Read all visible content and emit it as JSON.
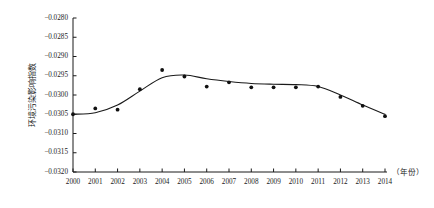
{
  "chart_data": {
    "type": "scatter",
    "title": "",
    "subtitle": "",
    "xlabel": "（年份）",
    "ylabel": "环境污染影响指数",
    "x": [
      2000,
      2001,
      2002,
      2003,
      2004,
      2005,
      2006,
      2007,
      2008,
      2009,
      2010,
      2011,
      2012,
      2013,
      2014
    ],
    "categories": [
      "2000",
      "2001",
      "2002",
      "2003",
      "2004",
      "2005",
      "2006",
      "2007",
      "2008",
      "2009",
      "2010",
      "2011",
      "2012",
      "2013",
      "2014"
    ],
    "values": [
      -0.0305,
      -0.03035,
      -0.03038,
      -0.02985,
      -0.02935,
      -0.02952,
      -0.02978,
      -0.02967,
      -0.0298,
      -0.0298,
      -0.0298,
      -0.02978,
      -0.03005,
      -0.03028,
      -0.03055
    ],
    "series": [
      {
        "name": "环境污染影响指数",
        "marker": "filled-circle",
        "color": "#111111",
        "values": [
          -0.0305,
          -0.03035,
          -0.03038,
          -0.02985,
          -0.02935,
          -0.02952,
          -0.02978,
          -0.02967,
          -0.0298,
          -0.0298,
          -0.0298,
          -0.02978,
          -0.03005,
          -0.03028,
          -0.03055
        ]
      },
      {
        "name": "trend-fit",
        "marker": "none",
        "color": "#333333",
        "values": [
          -0.0305,
          -0.03046,
          -0.03026,
          -0.0299,
          -0.02955,
          -0.02948,
          -0.02958,
          -0.02965,
          -0.0297,
          -0.02972,
          -0.02973,
          -0.02978,
          -0.03,
          -0.03026,
          -0.0305
        ]
      }
    ],
    "ylim": [
      -0.032,
      -0.028
    ],
    "xlim": [
      2000,
      2014
    ],
    "yticks": [
      -0.028,
      -0.0285,
      -0.029,
      -0.0295,
      -0.03,
      -0.0305,
      -0.031,
      -0.0315,
      -0.032
    ],
    "ytick_labels": [
      "−0.0280",
      "−0.0285",
      "−0.0290",
      "−0.0295",
      "−0.0300",
      "−0.0305",
      "−0.0310",
      "−0.0315",
      "−0.0320"
    ],
    "xtick_labels": [
      "2000",
      "2001",
      "2002",
      "2003",
      "2004",
      "2005",
      "2006",
      "2007",
      "2008",
      "2009",
      "2010",
      "2011",
      "2012",
      "2013",
      "2014"
    ],
    "grid": false,
    "legend": "none",
    "annotations": []
  }
}
